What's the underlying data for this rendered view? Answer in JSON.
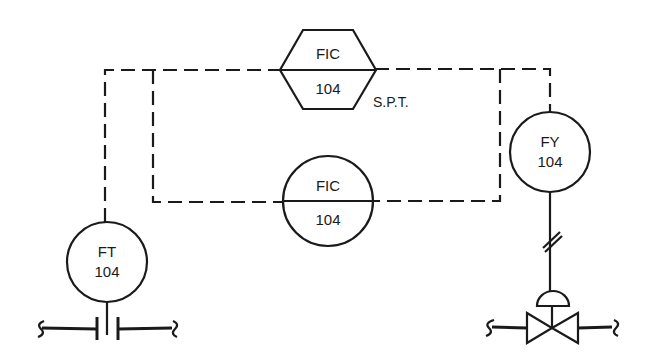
{
  "diagram": {
    "type": "P&ID flow control loop",
    "instruments": {
      "fic_hex": {
        "function": "FIC",
        "loop": "104",
        "shape": "hexagon",
        "note": "S.P.T."
      },
      "fic_circle": {
        "function": "FIC",
        "loop": "104",
        "shape": "circle-with-line"
      },
      "fy": {
        "function": "FY",
        "loop": "104",
        "shape": "circle"
      },
      "ft": {
        "function": "FT",
        "loop": "104",
        "shape": "circle"
      }
    },
    "annotations": {
      "setpoint_label": "S.P.T."
    },
    "elements": [
      "orifice-plate",
      "control-valve",
      "diaphragm-actuator",
      "pneumatic-signal-line",
      "electric-signal-line"
    ],
    "colors": {
      "line": "#1a1a1a",
      "background": "#ffffff"
    }
  }
}
